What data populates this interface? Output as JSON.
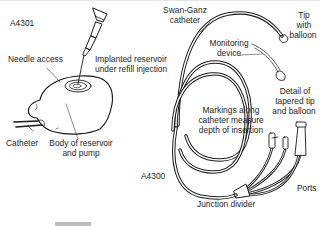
{
  "figure": {
    "left": {
      "code": "A4301",
      "labels": {
        "needle_access": "Needle access",
        "reservoir_line1": "Implanted reservoir",
        "reservoir_line2": "under refill injection",
        "catheter": "Catheter",
        "body_line1": "Body of reservoir",
        "body_line2": "and pump"
      }
    },
    "right": {
      "code": "A4300",
      "labels": {
        "swan_line1": "Swan-Ganz",
        "swan_line2": "catheter",
        "tip_line1": "Tip",
        "tip_line2": "with",
        "tip_line3": "balloon",
        "monitor_line1": "Monitoring",
        "monitor_line2": "device",
        "detail_line1": "Detail of",
        "detail_line2": "tapered tip",
        "detail_line3": "and balloon",
        "markings_line1": "Markings along",
        "markings_line2": "catheter measure",
        "markings_line3": "depth of insertion",
        "ports": "Ports",
        "junction": "Junction divider"
      }
    }
  },
  "colors": {
    "line": "#1a1a1a",
    "scrollbar": "#bdbdbd"
  }
}
